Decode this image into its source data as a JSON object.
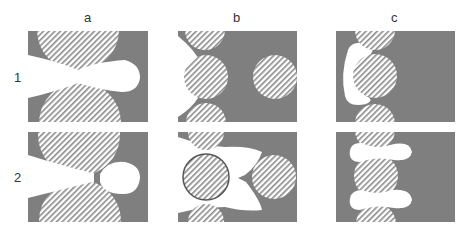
{
  "columns": [
    {
      "label": "a",
      "x": 88
    },
    {
      "label": "b",
      "x": 237
    },
    {
      "label": "c",
      "x": 395
    }
  ],
  "rows": [
    {
      "label": "1",
      "y": 77
    },
    {
      "label": "2",
      "y": 177
    }
  ],
  "colors": {
    "solid": "#7f7f7f",
    "void": "#ffffff",
    "hatch": "#8a8a8a"
  },
  "legend_semantics": {
    "hatched_circle": "grain/particle",
    "grey": "solid phase",
    "white": "pore/void"
  }
}
